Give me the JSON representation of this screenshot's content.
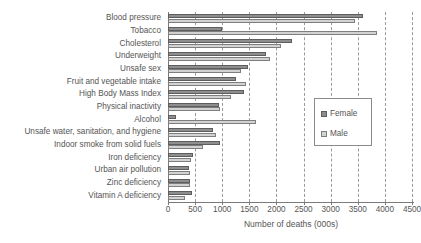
{
  "chart_data": {
    "type": "bar",
    "orientation": "horizontal",
    "title": "",
    "xlabel": "Number of deaths (000s)",
    "ylabel": "",
    "xlim": [
      0,
      4500
    ],
    "xticks": [
      0,
      500,
      1000,
      1500,
      2000,
      2500,
      3000,
      3500,
      4000,
      4500
    ],
    "xtick_labels": [
      "0",
      "500",
      "1000",
      "1500",
      "2000",
      "2500",
      "3000",
      "3500",
      "4000",
      "4500"
    ],
    "grid": true,
    "grid_axis": "x",
    "grid_style": "dashed",
    "legend_position": "center-right",
    "categories": [
      "Blood pressure",
      "Tobacco",
      "Cholesterol",
      "Underweight",
      "Unsafe sex",
      "Fruit and vegetable intake",
      "High Body Mass Index",
      "Physical inactivity",
      "Alcohol",
      "Unsafe water, sanitation, and hygiene",
      "Indoor smoke from solid fuels",
      "Iron deficiency",
      "Urban air pollution",
      "Zinc deficiency",
      "Vitamin A deficiency"
    ],
    "series": [
      {
        "name": "Female",
        "color": "#8e8e8e",
        "values": [
          3600,
          1000,
          2280,
          1800,
          1480,
          1250,
          1400,
          940,
          150,
          830,
          950,
          470,
          380,
          400,
          440
        ]
      },
      {
        "name": "Male",
        "color": "#d2d2d2",
        "values": [
          3450,
          3850,
          2080,
          1880,
          1350,
          1440,
          1170,
          950,
          1620,
          880,
          650,
          430,
          400,
          400,
          310
        ]
      }
    ]
  },
  "legend": {
    "items": [
      {
        "label": "Female",
        "swatch": "female-swatch-icon"
      },
      {
        "label": "Male",
        "swatch": "male-swatch-icon"
      }
    ]
  },
  "axis": {
    "x_title": "Number of deaths (000s)"
  }
}
